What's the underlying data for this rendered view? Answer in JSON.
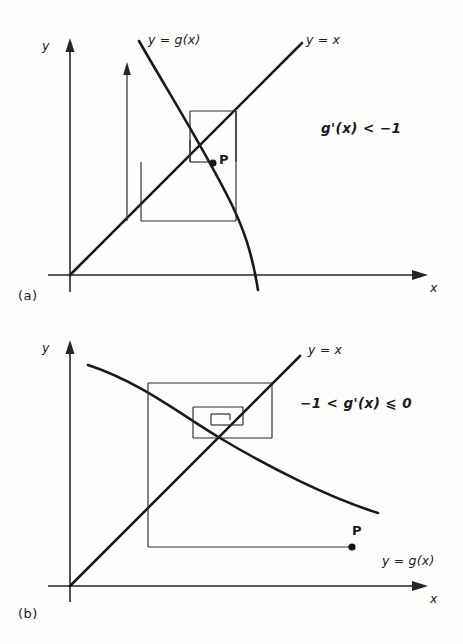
{
  "figure": {
    "background": "#fdfdfb",
    "ink": "#1a1a1a"
  },
  "panels": [
    {
      "id": "a",
      "caption": "(a)",
      "condition": "g'(x) < −1",
      "axis_x_label": "x",
      "axis_y_label": "y",
      "curve_label": "y = g(x)",
      "line_label": "y = x",
      "point_label": "P",
      "behaviour": "divergent outward spiral"
    },
    {
      "id": "b",
      "caption": "(b)",
      "condition": "−1 < g'(x) ⩽ 0",
      "axis_x_label": "x",
      "axis_y_label": "y",
      "curve_label": "y = g(x)",
      "line_label": "y = x",
      "point_label": "P",
      "behaviour": "convergent inward spiral"
    }
  ]
}
